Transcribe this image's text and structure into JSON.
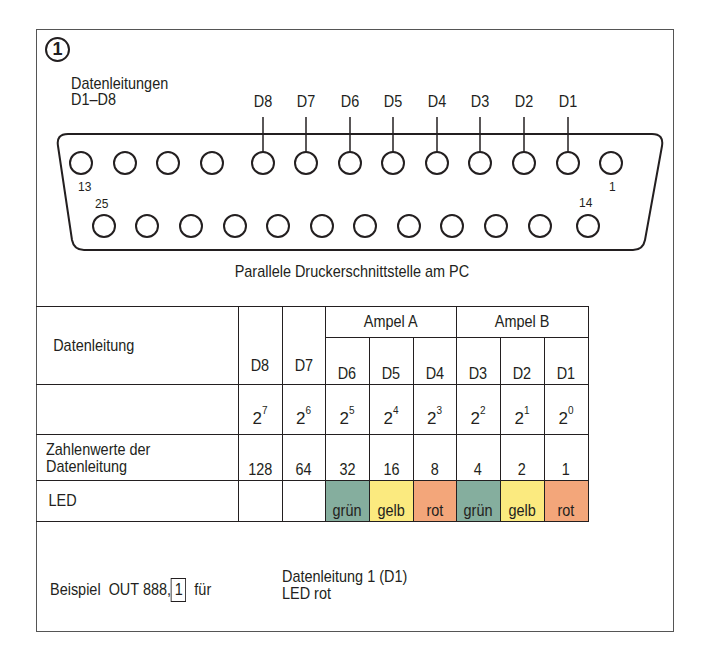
{
  "figure_number": "1",
  "connector": {
    "title_line1": "Datenleitungen",
    "title_line2": "D1–D8",
    "data_line_labels": [
      "D8",
      "D7",
      "D6",
      "D5",
      "D4",
      "D3",
      "D2",
      "D1"
    ],
    "pin_labels": {
      "top_left": "13",
      "bottom_left": "25",
      "top_right": "1",
      "bottom_right": "14"
    },
    "top_row_pins": 13,
    "bottom_row_pins": 12,
    "caption": "Parallele Druckerschnittstelle am PC"
  },
  "table": {
    "group_headers": {
      "ampel_a": "Ampel A",
      "ampel_b": "Ampel B"
    },
    "row_labels": {
      "datenleitung": "Datenleitung",
      "powers": "",
      "values": "Zahlenwerte der Datenleitung",
      "led": "LED"
    },
    "columns": [
      {
        "line": "D8",
        "base": "2",
        "exp": "7",
        "value": "128",
        "led": ""
      },
      {
        "line": "D7",
        "base": "2",
        "exp": "6",
        "value": "64",
        "led": ""
      },
      {
        "line": "D6",
        "base": "2",
        "exp": "5",
        "value": "32",
        "led": "grün"
      },
      {
        "line": "D5",
        "base": "2",
        "exp": "4",
        "value": "16",
        "led": "gelb"
      },
      {
        "line": "D4",
        "base": "2",
        "exp": "3",
        "value": "8",
        "led": "rot"
      },
      {
        "line": "D3",
        "base": "2",
        "exp": "2",
        "value": "4",
        "led": "grün"
      },
      {
        "line": "D2",
        "base": "2",
        "exp": "1",
        "value": "2",
        "led": "gelb"
      },
      {
        "line": "D1",
        "base": "2",
        "exp": "0",
        "value": "1",
        "led": "rot"
      }
    ],
    "led_colors": {
      "grün": "#85ae9e",
      "gelb": "#fbea7f",
      "rot": "#f3a67a"
    }
  },
  "example": {
    "prefix": "Beispiel  OUT 888,",
    "boxed_value": "1",
    "fuer": "für",
    "line1": "Datenleitung 1 (D1)",
    "line2": "LED rot"
  }
}
